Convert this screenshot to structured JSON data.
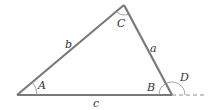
{
  "diagram": {
    "colors": {
      "side": "#7a7a7a",
      "arc": "#8a8a8a",
      "label": "#333333",
      "dash": "#8a8a8a"
    },
    "vertices": {
      "A": {
        "x": 17,
        "y": 95
      },
      "B": {
        "x": 172,
        "y": 95
      },
      "C": {
        "x": 124,
        "y": 5
      }
    },
    "sides": [
      {
        "name": "a",
        "label": "a"
      },
      {
        "name": "b",
        "label": "b"
      },
      {
        "name": "c",
        "label": "c"
      }
    ],
    "angles": [
      {
        "name": "A",
        "label": "A"
      },
      {
        "name": "B",
        "label": "B"
      },
      {
        "name": "C",
        "label": "C"
      },
      {
        "name": "D",
        "label": "D"
      }
    ]
  }
}
